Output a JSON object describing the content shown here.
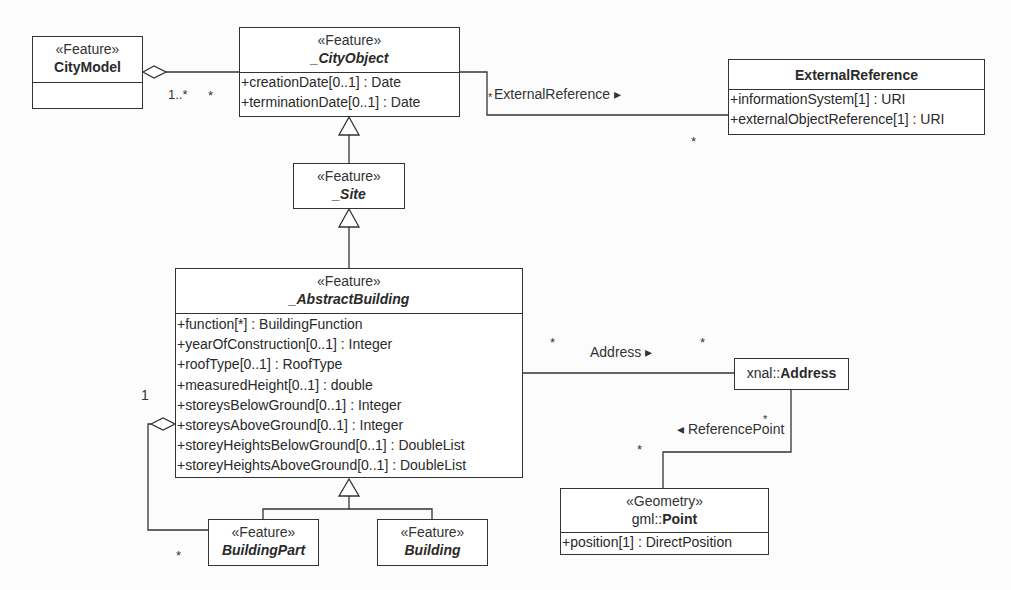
{
  "diagram": {
    "type": "UML class diagram",
    "classes": {
      "city_model": {
        "stereotype": "«Feature»",
        "name": "CityModel",
        "abstract": false,
        "attributes": []
      },
      "city_object": {
        "stereotype": "«Feature»",
        "name": "_CityObject",
        "abstract": true,
        "attributes": [
          "+creationDate[0..1] : Date",
          "+terminationDate[0..1] : Date"
        ]
      },
      "external_reference": {
        "name": "ExternalReference",
        "abstract": false,
        "attributes": [
          "+informationSystem[1] : URI",
          "+externalObjectReference[1] : URI"
        ]
      },
      "site": {
        "stereotype": "«Feature»",
        "name": "_Site",
        "abstract": true
      },
      "abstract_building": {
        "stereotype": "«Feature»",
        "name": "_AbstractBuilding",
        "abstract": true,
        "attributes": [
          "+function[*] : BuildingFunction",
          "+yearOfConstruction[0..1] : Integer",
          "+roofType[0..1] : RoofType",
          "+measuredHeight[0..1] : double",
          "+storeysBelowGround[0..1] : Integer",
          "+storeysAboveGround[0..1] : Integer",
          "+storeyHeightsBelowGround[0..1] : DoubleList",
          "+storeyHeightsAboveGround[0..1] : DoubleList"
        ]
      },
      "building_part": {
        "stereotype": "«Feature»",
        "name": "BuildingPart"
      },
      "building": {
        "stereotype": "«Feature»",
        "name": "Building"
      },
      "address": {
        "namespace": "xnal::",
        "name": "Address"
      },
      "point": {
        "stereotype": "«Geometry»",
        "namespace": "gml::",
        "name": "Point",
        "attributes": [
          "+position[1] : DirectPosition"
        ]
      }
    },
    "associations": {
      "citymodel_cityobject": {
        "kind": "aggregation",
        "mult_source": "1..*",
        "mult_target": "*"
      },
      "external_reference": {
        "label": "ExternalReference ▸",
        "mult_source": "*",
        "mult_target": "*"
      },
      "address": {
        "label": "Address ▸",
        "mult_source": "*",
        "mult_target": "*"
      },
      "reference_point": {
        "label": "◂ ReferencePoint",
        "mult_source": "*",
        "mult_target": "*"
      },
      "building_part_aggregation": {
        "kind": "aggregation",
        "mult_source": "1",
        "mult_target": "*"
      }
    },
    "generalizations": [
      {
        "child": "_Site",
        "parent": "_CityObject"
      },
      {
        "child": "_AbstractBuilding",
        "parent": "_Site"
      },
      {
        "child": "BuildingPart",
        "parent": "_AbstractBuilding"
      },
      {
        "child": "Building",
        "parent": "_AbstractBuilding"
      }
    ]
  }
}
